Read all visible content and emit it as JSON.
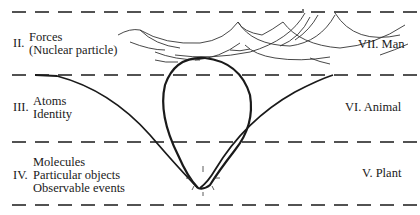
{
  "levels": {
    "II": {
      "numeral": "II.",
      "lines": [
        "Forces",
        "(Nuclear particle)"
      ]
    },
    "III": {
      "numeral": "III.",
      "lines": [
        "Atoms",
        "Identity"
      ]
    },
    "IV": {
      "numeral": "IV.",
      "lines": [
        "Molecules",
        "Particular objects",
        "Observable events"
      ]
    },
    "VII": {
      "label": "VII.  Man"
    },
    "VI": {
      "label": "VI.  Animal"
    },
    "V": {
      "label": "V.  Plant"
    }
  },
  "colors": {
    "ink": "#1a1a1a",
    "background": "#ffffff"
  }
}
